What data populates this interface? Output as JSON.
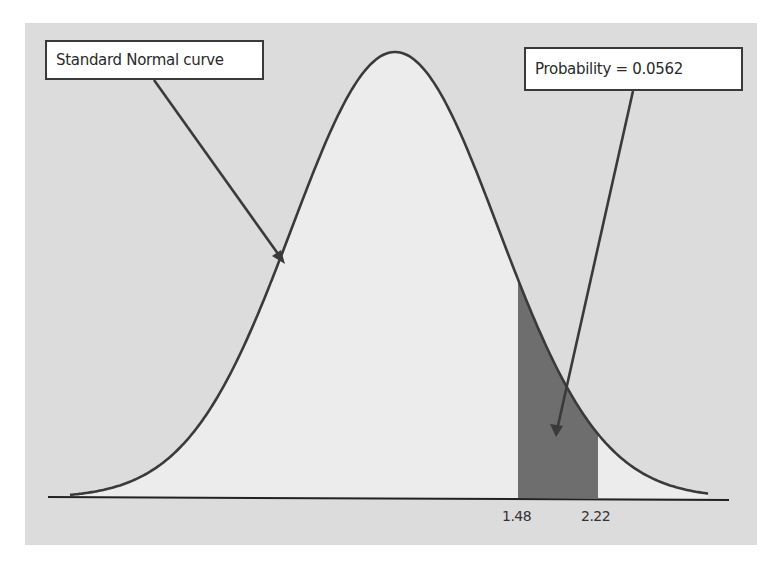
{
  "chart_data": {
    "type": "area",
    "title": "",
    "distribution": "Standard Normal",
    "xlabel": "",
    "ylabel": "",
    "grid": false,
    "legend": null,
    "x_ticks": [
      1.48,
      2.22
    ],
    "x_tick_labels": [
      "1.48",
      "2.22"
    ],
    "shaded_region": {
      "from": 1.48,
      "to": 2.22,
      "probability": 0.0562
    },
    "annotations": [
      {
        "text": "Standard Normal curve",
        "points_to": "curve (left side)"
      },
      {
        "text": "Probability = 0.0562",
        "points_to": "shaded region between 1.48 and 2.22"
      }
    ],
    "colors": {
      "background": "#dcdcdc",
      "under_curve_fill": "#ececec",
      "shaded_fill": "#6e6e6e",
      "curve_stroke": "#3a3a3a"
    }
  },
  "annotations": {
    "curve_label": "Standard Normal curve",
    "probability_label": "Probability = 0.0562"
  },
  "axis": {
    "ticks": [
      "1.48",
      "2.22"
    ]
  }
}
